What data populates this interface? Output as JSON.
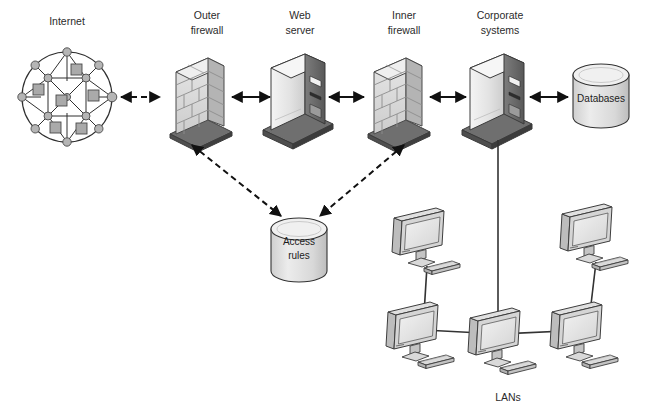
{
  "diagram": {
    "background": "#ffffff",
    "labels": {
      "internet": "Internet",
      "outer_firewall_line1": "Outer",
      "outer_firewall_line2": "firewall",
      "web_server_line1": "Web",
      "web_server_line2": "server",
      "inner_firewall_line1": "Inner",
      "inner_firewall_line2": "firewall",
      "corporate_systems_line1": "Corporate",
      "corporate_systems_line2": "systems",
      "databases": "Databases",
      "access_rules_line1": "Access",
      "access_rules_line2": "rules",
      "lans": "LANs"
    },
    "nodes": [
      {
        "id": "internet",
        "type": "mesh-cloud",
        "label": "Internet",
        "cx": 67,
        "cy": 97
      },
      {
        "id": "outer-firewall",
        "type": "brick-wall",
        "label": "Outer firewall",
        "cx": 199,
        "cy": 97
      },
      {
        "id": "web-server",
        "type": "server-tower",
        "label": "Web server",
        "cx": 298,
        "cy": 97
      },
      {
        "id": "inner-firewall",
        "type": "brick-wall",
        "label": "Inner firewall",
        "cx": 396,
        "cy": 97
      },
      {
        "id": "corporate-systems",
        "type": "server-tower",
        "label": "Corporate systems",
        "cx": 497,
        "cy": 97
      },
      {
        "id": "databases",
        "type": "cylinder",
        "label": "Databases",
        "cx": 602,
        "cy": 97
      },
      {
        "id": "access-rules",
        "type": "cylinder",
        "label": "Access rules",
        "cx": 298,
        "cy": 248
      },
      {
        "id": "lan-top-left",
        "type": "workstation",
        "cx": 424,
        "cy": 240
      },
      {
        "id": "lan-top-right",
        "type": "workstation",
        "cx": 592,
        "cy": 236
      },
      {
        "id": "lan-bottom-left",
        "type": "workstation",
        "cx": 418,
        "cy": 334
      },
      {
        "id": "lan-bottom-center",
        "type": "workstation",
        "cx": 500,
        "cy": 340
      },
      {
        "id": "lan-bottom-right",
        "type": "workstation",
        "cx": 582,
        "cy": 334
      }
    ],
    "connections": [
      {
        "from": "internet",
        "to": "outer-firewall",
        "style": "dashed",
        "arrows": "both"
      },
      {
        "from": "outer-firewall",
        "to": "web-server",
        "style": "solid",
        "arrows": "both"
      },
      {
        "from": "web-server",
        "to": "inner-firewall",
        "style": "solid",
        "arrows": "both"
      },
      {
        "from": "inner-firewall",
        "to": "corporate-systems",
        "style": "solid",
        "arrows": "both"
      },
      {
        "from": "corporate-systems",
        "to": "databases",
        "style": "solid",
        "arrows": "both"
      },
      {
        "from": "outer-firewall",
        "to": "access-rules",
        "style": "dashed",
        "arrows": "both"
      },
      {
        "from": "inner-firewall",
        "to": "access-rules",
        "style": "dashed",
        "arrows": "both"
      },
      {
        "from": "corporate-systems",
        "to": "lan-bottom-center",
        "style": "plain",
        "arrows": "none"
      },
      {
        "from": "lan-top-left",
        "to": "lan-bottom-left",
        "style": "plain",
        "arrows": "none"
      },
      {
        "from": "lan-top-right",
        "to": "lan-bottom-right",
        "style": "plain",
        "arrows": "none"
      },
      {
        "from": "lan-bottom-left",
        "to": "lan-bottom-center",
        "style": "plain",
        "arrows": "none"
      },
      {
        "from": "lan-bottom-center",
        "to": "lan-bottom-right",
        "style": "plain",
        "arrows": "none"
      }
    ],
    "colors": {
      "line": "#1a1a1a",
      "text": "#2b2b2b",
      "brick_light": "#e2e2e2",
      "brick_mid": "#cfcfcf",
      "brick_dark": "#a9a9a9",
      "server_light": "#ededed",
      "server_mid": "#d2d2d2",
      "server_dark": "#4a4a4a",
      "base_gray": "#6e6e6e",
      "cyl_fill": "#dcdcdc",
      "mesh_node": "#b0b0b0",
      "mesh_square": "#adadad",
      "monitor_screen": "#e8e8e8",
      "monitor_body": "#c9c9c9"
    }
  }
}
